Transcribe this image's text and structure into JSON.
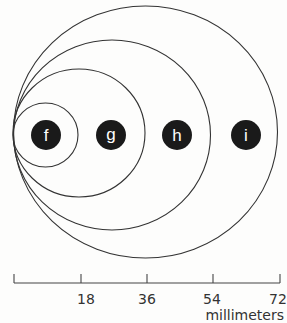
{
  "diagram": {
    "circles": [
      {
        "label": "f",
        "diameter_mm": 18
      },
      {
        "label": "g",
        "diameter_mm": 36
      },
      {
        "label": "h",
        "diameter_mm": 54
      },
      {
        "label": "i",
        "diameter_mm": 72
      }
    ],
    "scale": {
      "ticks": [
        "18",
        "36",
        "54",
        "72"
      ],
      "unit": "millimeters"
    }
  }
}
